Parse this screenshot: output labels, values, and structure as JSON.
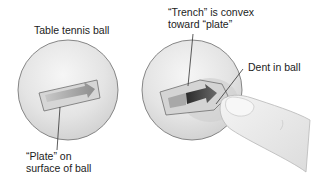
{
  "diagram": {
    "panels": [
      {
        "id": "undented",
        "title": "Table tennis ball",
        "callouts": [
          {
            "lines": [
              "“Plate” on",
              "surface of ball"
            ]
          }
        ]
      },
      {
        "id": "dented",
        "callouts": [
          {
            "lines": [
              "“Trench” is convex",
              "toward “plate”"
            ]
          },
          {
            "lines": [
              "Dent in ball"
            ]
          }
        ]
      }
    ],
    "colors": {
      "ball_fill": "#e6e6e6",
      "ball_outline": "#7a7a7a",
      "plate_fill": "#d2d2d2",
      "arrow_light": "#b8b8b8",
      "arrow_dark": "#3a3a3a",
      "finger_fill": "#ededed",
      "leader_line": "#333333",
      "text": "#1c1c1c"
    }
  }
}
